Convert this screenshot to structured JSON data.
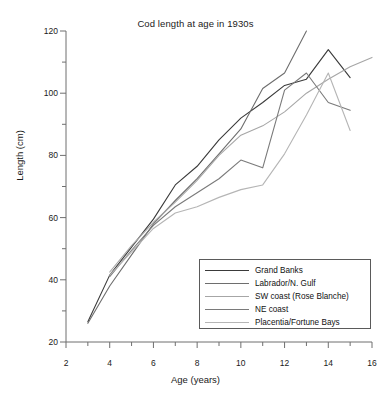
{
  "chart_data": {
    "type": "line",
    "title": "Cod length at age in 1930s",
    "xlabel": "Age (years)",
    "ylabel": "Length (cm)",
    "xlim": [
      2,
      16
    ],
    "ylim": [
      20,
      120
    ],
    "xticks": [
      2,
      4,
      6,
      8,
      10,
      12,
      14,
      16
    ],
    "yticks": [
      20,
      40,
      60,
      80,
      100,
      120
    ],
    "xminor_step": 1,
    "yminor_step": 10,
    "grid": false,
    "legend_position": "lower right",
    "series": [
      {
        "name": "Grand Banks",
        "color": "#3a3a3a",
        "x": [
          3,
          4,
          5,
          6,
          7,
          8,
          9,
          10,
          11,
          12,
          13,
          14,
          15
        ],
        "y": [
          26.5,
          41.5,
          50.5,
          59.5,
          70.5,
          76.5,
          85.0,
          92.0,
          97.0,
          102.5,
          104.5,
          114.0,
          105.0
        ]
      },
      {
        "name": "Labrador/N. Gulf",
        "color": "#6e6e6e",
        "x": [
          3,
          4,
          5,
          6,
          7,
          8,
          9,
          10,
          11,
          12,
          13
        ],
        "y": [
          26.0,
          38.0,
          48.0,
          58.0,
          65.5,
          72.5,
          80.5,
          88.5,
          101.5,
          106.5,
          120.0
        ]
      },
      {
        "name": "SW coast (Rose Blanche)",
        "color": "#a6a6a6",
        "x": [
          4,
          5,
          6,
          7,
          8,
          9,
          10,
          11,
          12,
          13,
          14,
          15,
          16
        ],
        "y": [
          42.5,
          51.0,
          58.5,
          65.0,
          72.0,
          80.0,
          86.5,
          89.5,
          94.0,
          100.0,
          104.5,
          108.5,
          111.5
        ]
      },
      {
        "name": "NE coast",
        "color": "#7a7a7a",
        "x": [
          4,
          5,
          6,
          7,
          8,
          9,
          10,
          11,
          12,
          13,
          14,
          15
        ],
        "y": [
          41.0,
          49.5,
          57.5,
          63.5,
          68.0,
          72.5,
          78.5,
          76.0,
          101.0,
          106.5,
          97.0,
          94.5
        ]
      },
      {
        "name": "Placentia/Fortune Bays",
        "color": "#b5b5b5",
        "x": [
          4,
          5,
          6,
          7,
          8,
          9,
          10,
          11,
          12,
          13,
          14,
          15
        ],
        "y": [
          41.5,
          49.0,
          56.5,
          61.5,
          63.5,
          66.5,
          69.0,
          70.5,
          80.5,
          93.0,
          106.5,
          88.0
        ]
      }
    ]
  },
  "legend": {
    "items": [
      {
        "label": "Grand Banks"
      },
      {
        "label": "Labrador/N. Gulf"
      },
      {
        "label": "SW coast (Rose Blanche)"
      },
      {
        "label": "NE coast"
      },
      {
        "label": "Placentia/Fortune Bays"
      }
    ]
  }
}
